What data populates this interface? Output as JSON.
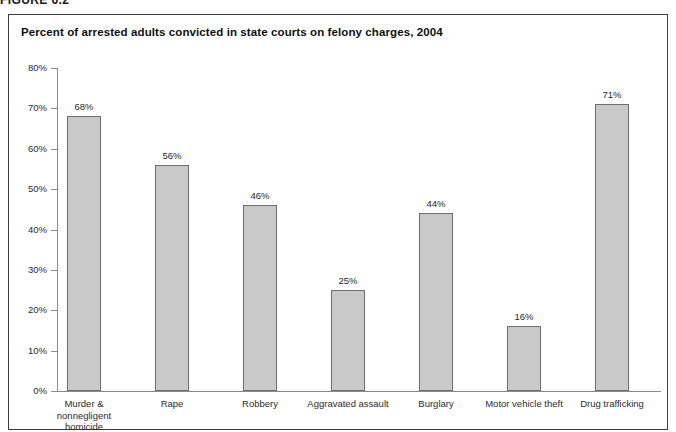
{
  "figure_header": "FIGURE 6.2",
  "chart_data": {
    "type": "bar",
    "title": "Percent of arrested adults convicted in state courts on felony charges, 2004",
    "xlabel": "",
    "ylabel": "",
    "ylim": [
      0,
      80
    ],
    "grid": false,
    "legend": false,
    "categories": [
      "Murder &\nnonnegligent\nhomicide",
      "Rape",
      "Robbery",
      "Aggravated assault",
      "Burglary",
      "Motor vehicle theft",
      "Drug trafficking"
    ],
    "category_labels": [
      [
        "Murder &",
        "nonnegligent",
        "homicide"
      ],
      [
        "Rape"
      ],
      [
        "Robbery"
      ],
      [
        "Aggravated assault"
      ],
      [
        "Burglary"
      ],
      [
        "Motor vehicle theft"
      ],
      [
        "Drug trafficking"
      ]
    ],
    "values": [
      68,
      56,
      46,
      25,
      44,
      16,
      71
    ],
    "value_labels": [
      "68%",
      "56%",
      "46%",
      "25%",
      "44%",
      "16%",
      "71%"
    ],
    "ticks": [
      80,
      70,
      60,
      50,
      40,
      30,
      20,
      10,
      0
    ],
    "tick_labels": [
      "80%",
      "70%",
      "60%",
      "50%",
      "40%",
      "30%",
      "20%",
      "10%",
      "0%"
    ],
    "bar_color": "#c9c9c9",
    "bar_border_color": "#6e6e6e",
    "axis_color": "#8a8a8a"
  }
}
